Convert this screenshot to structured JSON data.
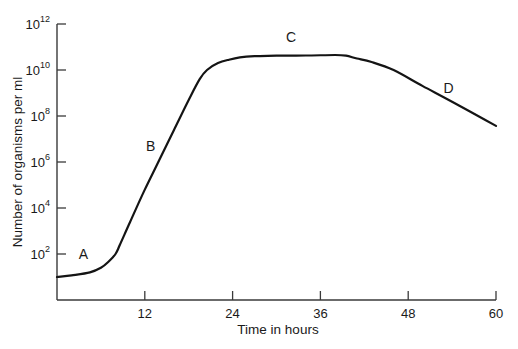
{
  "chart_data": {
    "type": "line",
    "title": "",
    "xlabel": "Time in hours",
    "ylabel": "Number of organisms per ml",
    "x_scale": "linear",
    "y_scale": "log10",
    "xlim": [
      0,
      60
    ],
    "ylim_log10": [
      0,
      12
    ],
    "x_ticks": [
      12,
      24,
      36,
      48,
      60
    ],
    "y_ticks": [
      {
        "base": "10",
        "exp": "2",
        "log": 2
      },
      {
        "base": "10",
        "exp": "4",
        "log": 4
      },
      {
        "base": "10",
        "exp": "6",
        "log": 6
      },
      {
        "base": "10",
        "exp": "8",
        "log": 8
      },
      {
        "base": "10",
        "exp": "10",
        "log": 10
      },
      {
        "base": "10",
        "exp": "12",
        "log": 12
      }
    ],
    "grid": false,
    "legend": null,
    "series": [
      {
        "name": "Bacterial growth curve",
        "x": [
          0,
          2,
          4.5,
          6,
          7,
          8,
          8.6,
          10,
          12,
          14,
          16,
          18,
          19.5,
          20.5,
          22,
          23.5,
          25,
          27,
          30,
          34,
          38,
          39.5,
          41,
          43,
          46,
          50,
          55,
          60
        ],
        "log10_y": [
          1.0,
          1.07,
          1.2,
          1.4,
          1.65,
          2.0,
          2.4,
          3.4,
          4.8,
          6.1,
          7.4,
          8.7,
          9.6,
          10.0,
          10.3,
          10.45,
          10.55,
          10.6,
          10.62,
          10.63,
          10.65,
          10.62,
          10.5,
          10.35,
          10.0,
          9.3,
          8.45,
          7.57
        ]
      }
    ],
    "annotations": [
      {
        "label": "A",
        "x": 3.6,
        "log10_y": 1.8,
        "phase": "lag"
      },
      {
        "label": "B",
        "x": 12.8,
        "log10_y": 6.5,
        "phase": "exponential"
      },
      {
        "label": "C",
        "x": 32,
        "log10_y": 11.2,
        "phase": "stationary"
      },
      {
        "label": "D",
        "x": 53.5,
        "log10_y": 9.0,
        "phase": "death"
      }
    ]
  },
  "axes": {
    "x_title": "Time in hours",
    "y_title": "Number of organisms per ml"
  },
  "colors": {
    "line": "#141414",
    "axis": "#3a3a3a",
    "background": "#ffffff"
  }
}
